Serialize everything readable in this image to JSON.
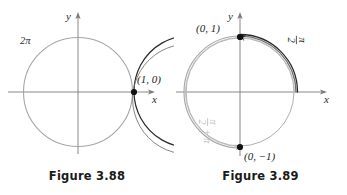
{
  "document": {
    "kind": "textbook-figure-pair",
    "background_color": "#ffffff"
  },
  "figures": [
    {
      "id": "figure-3-88",
      "caption": "Figure 3.88",
      "axes": {
        "x_label": "x",
        "y_label": "y"
      },
      "colors": {
        "dark_curve": "#2b2b2b",
        "gray_curve": "#9a9a9a",
        "axis": "#7b7b7b",
        "point": "#111111"
      },
      "points": [
        {
          "name": "start-point",
          "label": "(1, 0)",
          "x": 1,
          "y": 0
        }
      ],
      "arc_labels": [
        {
          "name": "full-revolution-label",
          "text": "2π",
          "tone": "dark"
        }
      ]
    },
    {
      "id": "figure-3-89",
      "caption": "Figure 3.89",
      "axes": {
        "x_label": "x",
        "y_label": "y"
      },
      "colors": {
        "dark_curve": "#2b2b2b",
        "gray_curve": "#a8a8a8",
        "axis": "#7b7b7b",
        "point": "#111111"
      },
      "points": [
        {
          "name": "quarter-turn-point",
          "label": "(0, 1)",
          "x": 0,
          "y": 1
        },
        {
          "name": "three-quarter-turn-point",
          "label": "(0, −1)",
          "x": 0,
          "y": -1
        }
      ],
      "arc_labels": [
        {
          "name": "pi-over-two-label",
          "numerator": "π",
          "denominator": "2",
          "tone": "dark"
        },
        {
          "name": "pi-over-two-plus-pi-label",
          "numerator": "π",
          "denominator": "2",
          "suffix": "+ π",
          "tone": "gray"
        }
      ]
    }
  ]
}
